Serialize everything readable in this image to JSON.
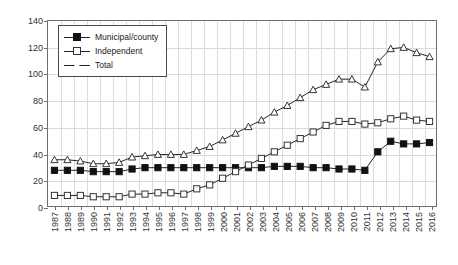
{
  "chart_data": {
    "type": "line",
    "title": "",
    "xlabel": "",
    "ylabel": "",
    "ylim": [
      0,
      140
    ],
    "ytick_step": 20,
    "yticks": [
      "0",
      "20",
      "40",
      "60",
      "80",
      "100",
      "120",
      "140"
    ],
    "grid": true,
    "legend_position": "top-left",
    "categories": [
      "1987",
      "1988",
      "1989",
      "1990",
      "1991",
      "1992",
      "1993",
      "1994",
      "1995",
      "1996",
      "1997",
      "1998",
      "1999",
      "2000",
      "2001",
      "2002",
      "2003",
      "2004",
      "2005",
      "2006",
      "2007",
      "2008",
      "2009",
      "2010",
      "2011",
      "2012",
      "2013",
      "2014",
      "2015",
      "2016"
    ],
    "series": [
      {
        "name": "Municipal/county",
        "marker": "filled-square",
        "values": [
          27,
          27,
          27,
          26,
          26,
          26,
          28,
          29,
          29,
          29,
          29,
          29,
          29,
          29,
          29,
          29,
          29,
          30,
          30,
          30,
          29,
          29,
          28,
          28,
          27,
          41,
          49,
          47,
          47,
          48
        ]
      },
      {
        "name": "Independent",
        "marker": "open-square",
        "values": [
          8,
          8,
          8,
          7,
          7,
          7,
          9,
          9,
          10,
          10,
          9,
          13,
          16,
          21,
          26,
          31,
          36,
          41,
          46,
          51,
          56,
          61,
          64,
          64,
          62,
          63,
          66,
          68,
          65,
          64
        ]
      },
      {
        "name": "Total",
        "marker": "open-triangle",
        "values": [
          35,
          35,
          34,
          32,
          32,
          33,
          37,
          38,
          39,
          39,
          39,
          42,
          45,
          50,
          55,
          60,
          65,
          71,
          76,
          82,
          88,
          92,
          96,
          96,
          90,
          109,
          119,
          120,
          116,
          113
        ]
      }
    ]
  },
  "legend": {
    "items": [
      {
        "label": "Municipal/county",
        "marker": "filled-square"
      },
      {
        "label": "Independent",
        "marker": "open-square"
      },
      {
        "label": "Total",
        "marker": "open-triangle"
      }
    ]
  },
  "colors": {
    "series_line": "#222222",
    "marker_fill": "#111111",
    "marker_open": "#ffffff",
    "grid": "#d9d9d9",
    "axis": "#6e6e6e",
    "text": "#333333"
  }
}
